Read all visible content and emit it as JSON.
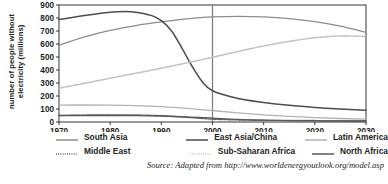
{
  "chart_data": {
    "type": "line",
    "title": "",
    "xlabel": "",
    "ylabel_line1": "number of people without",
    "ylabel_line2": "electricity (millions)",
    "ylabel": "number of people without electricity (millions)",
    "xlim": [
      1970,
      2030
    ],
    "ylim": [
      0,
      900
    ],
    "xticks": [
      1970,
      1980,
      1990,
      2000,
      2010,
      2020,
      2030
    ],
    "yticks": [
      0,
      100,
      200,
      300,
      400,
      500,
      600,
      700,
      800,
      900
    ],
    "grid": false,
    "legend_position": "bottom",
    "annotations": [
      {
        "type": "vertical-line",
        "x": 2000,
        "label": "2000"
      }
    ],
    "series": [
      {
        "name": "South Asia",
        "style": "solid",
        "color": "#8c8c8c",
        "width": 1.2,
        "x": [
          1970,
          1975,
          1980,
          1985,
          1990,
          1995,
          2000,
          2005,
          2010,
          2015,
          2020,
          2025,
          2030
        ],
        "values": [
          590,
          655,
          705,
          742,
          770,
          793,
          808,
          812,
          808,
          795,
          772,
          737,
          690
        ]
      },
      {
        "name": "East Asia/China",
        "style": "solid",
        "color": "#4d4d4d",
        "width": 1.5,
        "x": [
          1970,
          1975,
          1980,
          1983,
          1985,
          1988,
          1990,
          1992,
          1994,
          1996,
          1998,
          2000,
          2005,
          2010,
          2015,
          2020,
          2025,
          2030
        ],
        "values": [
          788,
          820,
          845,
          850,
          845,
          820,
          780,
          700,
          570,
          430,
          310,
          240,
          180,
          150,
          128,
          112,
          100,
          90
        ]
      },
      {
        "name": "Latin America",
        "style": "solid",
        "color": "#b3b3b3",
        "width": 1.4,
        "x": [
          1970,
          1975,
          1980,
          1985,
          1990,
          1995,
          2000,
          2005,
          2010,
          2015,
          2020,
          2025,
          2030
        ],
        "values": [
          130,
          131,
          130,
          126,
          118,
          105,
          88,
          70,
          55,
          43,
          34,
          27,
          22
        ]
      },
      {
        "name": "Middle East",
        "style": "dotted",
        "color": "#5a5a5a",
        "width": 1.4,
        "x": [
          1970,
          1975,
          1980,
          1985,
          1990,
          1995,
          2000,
          2005,
          2010,
          2015,
          2020,
          2025,
          2030
        ],
        "values": [
          50,
          53,
          55,
          54,
          48,
          36,
          22,
          16,
          13,
          12,
          11,
          10,
          10
        ]
      },
      {
        "name": "Sub-Saharan Africa",
        "style": "dotted",
        "color": "#c2c2c2",
        "width": 1.6,
        "x": [
          1970,
          1975,
          1980,
          1985,
          1990,
          1995,
          2000,
          2005,
          2010,
          2015,
          2020,
          2025,
          2030
        ],
        "values": [
          260,
          298,
          337,
          375,
          414,
          455,
          498,
          543,
          585,
          620,
          648,
          662,
          658
        ]
      },
      {
        "name": "North Africa",
        "style": "solid",
        "color": "#595959",
        "width": 1.3,
        "x": [
          1970,
          1975,
          1980,
          1985,
          1990,
          1995,
          2000,
          2005,
          2010,
          2015,
          2020,
          2025,
          2030
        ],
        "values": [
          50,
          50,
          50,
          49,
          46,
          40,
          30,
          20,
          14,
          10,
          8,
          6,
          5
        ]
      }
    ]
  },
  "legend": {
    "row1": [
      {
        "label": "South Asia",
        "style": "solid",
        "color": "#8c8c8c"
      },
      {
        "label": "East Asia/China",
        "style": "solid",
        "color": "#4d4d4d"
      },
      {
        "label": "Latin America",
        "style": "solid",
        "color": "#b3b3b3"
      }
    ],
    "row2": [
      {
        "label": "Middle East",
        "style": "dotted",
        "color": "#5a5a5a"
      },
      {
        "label": "Sub-Saharan Africa",
        "style": "dotted",
        "color": "#c2c2c2"
      },
      {
        "label": "North Africa",
        "style": "solid",
        "color": "#595959"
      }
    ]
  },
  "source": {
    "text": "Source: Adapted from http://www.worldenergyoutlook.org/model.asp"
  },
  "colors": {
    "axis": "#231f20",
    "text": "#231f20",
    "background": "#ffffff",
    "reference_line": "#808080"
  }
}
